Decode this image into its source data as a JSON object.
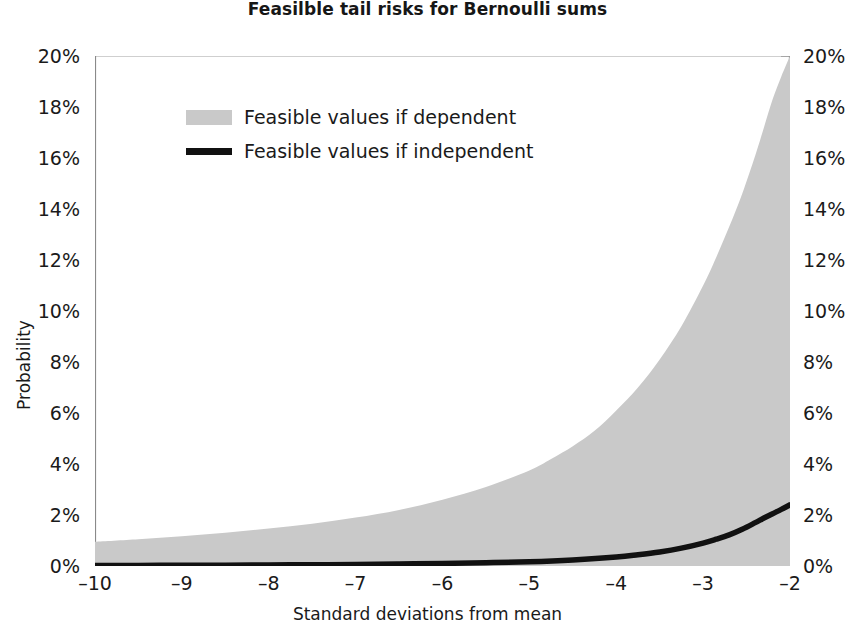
{
  "chart_data": {
    "type": "area",
    "title": "Feasilble tail risks for Bernoulli sums",
    "xlabel": "Standard deviations from mean",
    "ylabel": "Probability",
    "xlim": [
      -10,
      -2
    ],
    "ylim": [
      0,
      20
    ],
    "grid": false,
    "legend_position": "upper-left-inside",
    "x_tick_labels": [
      "–10",
      "–9",
      "–8",
      "–7",
      "–6",
      "–5",
      "–4",
      "–3",
      "–2"
    ],
    "x_tick_values": [
      -10,
      -9,
      -8,
      -7,
      -6,
      -5,
      -4,
      -3,
      -2
    ],
    "y_tick_labels": [
      "0%",
      "2%",
      "4%",
      "6%",
      "8%",
      "10%",
      "12%",
      "14%",
      "16%",
      "18%",
      "20%"
    ],
    "y_tick_values": [
      0,
      2,
      4,
      6,
      8,
      10,
      12,
      14,
      16,
      18,
      20
    ],
    "y_axis_right_tick_labels": [
      "0%",
      "2%",
      "4%",
      "6%",
      "8%",
      "10%",
      "12%",
      "14%",
      "16%",
      "18%",
      "20%"
    ],
    "series": [
      {
        "name": "Feasible values if dependent",
        "kind": "area",
        "color": "#c9c9c9",
        "x": [
          -10.0,
          -9.5,
          -9.0,
          -8.5,
          -8.0,
          -7.5,
          -7.0,
          -6.5,
          -6.0,
          -5.5,
          -5.0,
          -4.75,
          -4.5,
          -4.25,
          -4.0,
          -3.75,
          -3.5,
          -3.25,
          -3.0,
          -2.85,
          -2.7,
          -2.55,
          -2.4,
          -2.3,
          -2.2,
          -2.1,
          -2.0
        ],
        "values": [
          0.95,
          1.05,
          1.17,
          1.3,
          1.47,
          1.66,
          1.9,
          2.2,
          2.6,
          3.1,
          3.75,
          4.2,
          4.7,
          5.3,
          6.1,
          7.0,
          8.1,
          9.4,
          11.0,
          12.1,
          13.3,
          14.6,
          16.1,
          17.2,
          18.3,
          19.2,
          20.0
        ]
      },
      {
        "name": "Feasible values if independent",
        "kind": "line",
        "color": "#111111",
        "x": [
          -10.0,
          -9.5,
          -9.0,
          -8.5,
          -8.0,
          -7.5,
          -7.0,
          -6.5,
          -6.0,
          -5.5,
          -5.0,
          -4.5,
          -4.0,
          -3.75,
          -3.5,
          -3.25,
          -3.0,
          -2.85,
          -2.7,
          -2.55,
          -2.4,
          -2.3,
          -2.2,
          -2.1,
          -2.0
        ],
        "values": [
          0.02,
          0.02,
          0.03,
          0.03,
          0.04,
          0.05,
          0.06,
          0.08,
          0.1,
          0.13,
          0.17,
          0.24,
          0.35,
          0.44,
          0.55,
          0.7,
          0.9,
          1.05,
          1.22,
          1.44,
          1.7,
          1.88,
          2.05,
          2.22,
          2.4
        ]
      }
    ]
  },
  "legend": {
    "items": [
      {
        "label": "Feasible values if dependent",
        "swatch": "area-swatch"
      },
      {
        "label": "Feasible values if independent",
        "swatch": "line-swatch"
      }
    ]
  },
  "colors": {
    "background": "#ffffff",
    "axis": "#6b6b6b",
    "text": "#1a1a1a",
    "area_fill": "#c9c9c9",
    "line": "#111111",
    "gridline": "#cfcfcf"
  }
}
